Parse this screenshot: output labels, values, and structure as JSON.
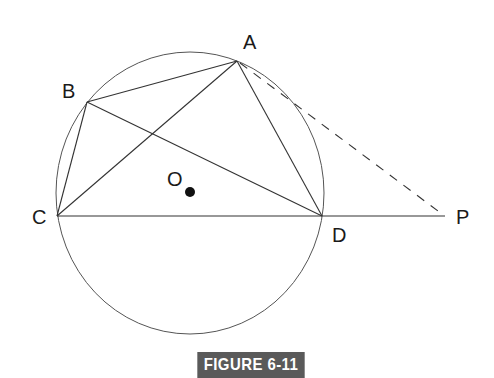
{
  "figure": {
    "caption": "FIGURE 6-11",
    "caption_bg": "#5a5a5a",
    "caption_color": "#ffffff"
  },
  "diagram": {
    "circle": {
      "center_label": "O",
      "cx": 190,
      "cy": 193,
      "rx": 135,
      "ry": 141
    },
    "points": {
      "A": {
        "label": "A",
        "x": 237,
        "y": 61
      },
      "B": {
        "label": "B",
        "x": 87,
        "y": 102
      },
      "C": {
        "label": "C",
        "x": 57,
        "y": 216
      },
      "D": {
        "label": "D",
        "x": 322,
        "y": 216
      },
      "P": {
        "label": "P",
        "x": 445,
        "y": 216
      },
      "O": {
        "label": "O",
        "x": 190,
        "y": 192
      }
    },
    "segments": [
      "AB",
      "BC",
      "CD",
      "DA",
      "AC",
      "BD",
      "DP"
    ],
    "dashed_segments": [
      "AP"
    ],
    "line_color": "#333333"
  }
}
